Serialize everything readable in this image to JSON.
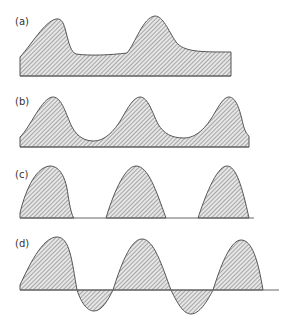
{
  "figure": {
    "panels": [
      {
        "id": "a",
        "label": "(a)",
        "description": "two-peak waveform with raised baseline, shaded to axis"
      },
      {
        "id": "b",
        "label": "(b)",
        "description": "three-peak periodic waveform with shallow valleys, shaded to axis"
      },
      {
        "id": "c",
        "label": "(c)",
        "description": "three separated half-wave rectified pulses"
      },
      {
        "id": "d",
        "label": "(d)",
        "description": "alternating waveform with positive peaks and negative troughs around the axis"
      }
    ]
  },
  "colors": {
    "stroke": "#555555",
    "hatch": "#8a8a8a",
    "axis": "#666666",
    "background": "#ffffff"
  }
}
